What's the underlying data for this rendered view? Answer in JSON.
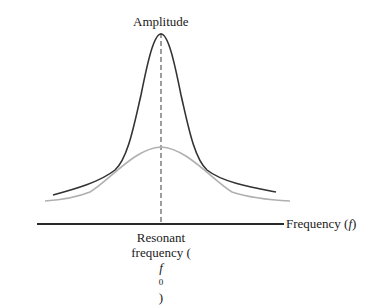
{
  "diagram": {
    "y_axis_label": "Amplitude",
    "x_axis_label": "Frequency (f)",
    "x_axis_label_parts": {
      "text": "Frequency (",
      "var": "f",
      "close": ")"
    },
    "marker_label_line1": "Resonant",
    "marker_label_line2_parts": {
      "text": "frequency (",
      "var": "f",
      "sub": "0",
      "close": ")"
    },
    "colors": {
      "axis": "#2a2a2a",
      "sharp_curve": "#333333",
      "broad_curve": "#b0b0b0",
      "marker": "#3a3a3a",
      "text": "#1a1a1a"
    },
    "curves": [
      {
        "name": "low-damping",
        "description": "tall sharp peak",
        "peak_y_px": 34,
        "color": "#333333"
      },
      {
        "name": "high-damping",
        "description": "low broad peak",
        "peak_y_px": 147,
        "color": "#b0b0b0"
      }
    ],
    "resonant_frequency_marker": {
      "x_px": 161,
      "style": "dashed"
    }
  }
}
